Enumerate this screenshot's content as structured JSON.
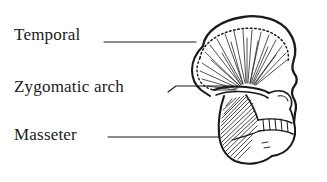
{
  "figure": {
    "background_color": "#ffffff",
    "ink_color": "#1a1a1a",
    "width": 327,
    "height": 182
  },
  "labels": [
    {
      "id": "temporal",
      "text": "Temporal",
      "structure_type": "muscle",
      "leader_line": "horizontal line from label to temporalis muscle on cranium"
    },
    {
      "id": "zygomatic",
      "text": "Zygomatic arch",
      "structure_type": "bone",
      "leader_line": "short kinked line from label to zygomatic arch"
    },
    {
      "id": "masseter",
      "text": "Masseter",
      "structure_type": "muscle",
      "leader_line": "long horizontal line from label to masseter muscle on mandible"
    }
  ],
  "illustration": {
    "subject": "primate skull, lateral (side) view facing right",
    "parts": [
      "cranium",
      "temporal line (dotted)",
      "temporalis muscle (fan hatching)",
      "zygomatic arch",
      "orbit",
      "nasal profile",
      "maxilla",
      "tooth row",
      "mandible",
      "masseter muscle (diagonal hatching)"
    ]
  },
  "icons": {
    "leader_line": "leader-line-icon"
  }
}
